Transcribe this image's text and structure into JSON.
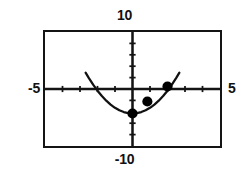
{
  "window_labels": {
    "ymax": "10",
    "ymin": "-10",
    "xmin": "-5",
    "xmax": "5"
  },
  "colors": {
    "ink": "#141414",
    "curve": "#111111",
    "point": "#000000",
    "background": "#ffffff"
  },
  "chart_data": {
    "type": "line",
    "title": "",
    "subtitle": "",
    "xlabel": "",
    "ylabel": "",
    "xlim": [
      -5,
      5
    ],
    "ylim": [
      -10,
      10
    ],
    "grid": false,
    "legend_position": "none",
    "x_tick_step": 1,
    "y_tick_step": 2,
    "axes_style": "crosshair-with-ticks",
    "series": [
      {
        "name": "parabola",
        "type": "line",
        "equation": "y = x^2 - 4.3",
        "vertex": [
          0,
          -4.3
        ],
        "x": [
          -2.68,
          -2.5,
          -2.25,
          -2.0,
          -1.75,
          -1.5,
          -1.25,
          -1.0,
          -0.75,
          -0.5,
          -0.25,
          0,
          0.25,
          0.5,
          0.75,
          1.0,
          1.25,
          1.5,
          1.75,
          2.0,
          2.25,
          2.5,
          2.68
        ],
        "y": [
          2.88,
          1.95,
          0.76,
          -0.3,
          -1.24,
          -2.05,
          -2.74,
          -3.3,
          -3.74,
          -4.05,
          -4.24,
          -4.3,
          -4.24,
          -4.05,
          -3.74,
          -3.3,
          -2.74,
          -2.05,
          -1.24,
          -0.3,
          0.76,
          1.95,
          2.88
        ]
      },
      {
        "name": "marked-points",
        "type": "scatter",
        "x": [
          0,
          0.85,
          2.0
        ],
        "y": [
          -4.3,
          -2.2,
          0.45
        ]
      }
    ]
  }
}
